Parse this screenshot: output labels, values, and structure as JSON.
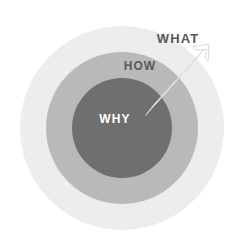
{
  "diagram": {
    "type": "concentric-circles",
    "background_color": "#ffffff",
    "center": {
      "x": 122,
      "y": 128
    },
    "rings": [
      {
        "id": "what",
        "label": "WHAT",
        "radius": 102,
        "fill": "#ededed",
        "label_color": "#58595b",
        "label_x": 178,
        "label_y": 43,
        "label_font_size": 13,
        "label_inside": false
      },
      {
        "id": "how",
        "label": "HOW",
        "radius": 76,
        "fill": "#b9b9b9",
        "label_color": "#58595b",
        "label_x": 140,
        "label_y": 70,
        "label_font_size": 12,
        "label_inside": true
      },
      {
        "id": "why",
        "label": "WHY",
        "radius": 50,
        "fill": "#6f6f6f",
        "label_color": "#ffffff",
        "label_x": 115,
        "label_y": 119,
        "label_font_size": 12,
        "label_inside": true
      }
    ],
    "arrow": {
      "id": "outward-arrow",
      "color": "#ffffff",
      "outline_color": "#c9c9c9",
      "from": {
        "x": 150,
        "y": 110
      },
      "to": {
        "x": 207,
        "y": 50
      },
      "thickness": 10,
      "description": "white arrow pointing outward from WHY toward WHAT"
    }
  }
}
